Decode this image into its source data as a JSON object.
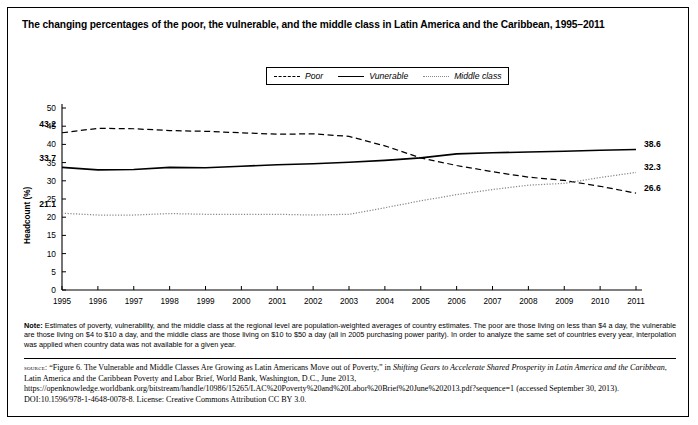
{
  "title": "The changing percentages of the poor, the vulnerable, and the middle class in Latin America and the Caribbean, 1995–2011",
  "legend": {
    "items": [
      {
        "label": "Poor",
        "style": "dashed",
        "color": "#000000"
      },
      {
        "label": "Vunerable",
        "style": "solid",
        "color": "#000000"
      },
      {
        "label": "Middle class",
        "style": "dotted",
        "color": "#888888"
      }
    ]
  },
  "axes": {
    "ylabel": "Headcount (%)",
    "yticks": [
      "0",
      "5",
      "10",
      "15",
      "20",
      "25",
      "30",
      "35",
      "40",
      "45",
      "50"
    ],
    "xticks": [
      "1995",
      "1996",
      "1997",
      "1998",
      "1999",
      "2000",
      "2001",
      "2002",
      "2003",
      "2004",
      "2005",
      "2006",
      "2007",
      "2008",
      "2009",
      "2010",
      "2011"
    ]
  },
  "annotations": {
    "start_poor": "43.2",
    "start_vulnerable": "33.7",
    "start_middle": "21.1",
    "end_vulnerable": "38.6",
    "end_middle": "32.3",
    "end_poor": "26.6"
  },
  "note": {
    "prefix": "Note:",
    "text": " Estimates of poverty, vulnerability, and the middle class at the regional level are population-weighted averages of country estimates. The poor are those living on less than $4 a day, the vulnerable are those living on $4 to $10 a day, and the middle class are those living on $10 to $50 a day (all in 2005 purchasing power parity). In order to analyze the same set of countries every year, interpolation was applied when country data was not available for a given year."
  },
  "source": {
    "prefix": "source:",
    "part1": " “Figure 6. The Vulnerable and Middle Classes Are Growing as Latin Americans Move out of Poverty,” in ",
    "italic1": "Shifting Gears to Accelerate Shared Prosperity in Latin America and the Caribbean",
    "part2": ", Latin America and the Caribbean Poverty and Labor Brief, World Bank, Washington, D.C., June 2013, https://openknowledge.worldbank.org/bitstream/handle/10986/15265/LAC%20Poverty%20and%20Labor%20Brief%20June%202013.pdf?sequence=1 (accessed September 30, 2013). DOI:10.1596/978-1-4648-0078-8. License: Creative Commons Attribution CC BY 3.0."
  },
  "chart_data": {
    "type": "line",
    "title": "The changing percentages of the poor, the vulnerable, and the middle class in Latin America and the Caribbean, 1995–2011",
    "xlabel": "",
    "ylabel": "Headcount (%)",
    "ylim": [
      0,
      50
    ],
    "ytick_step": 5,
    "grid": false,
    "legend_position": "top-center",
    "x": [
      1995,
      1996,
      1997,
      1998,
      1999,
      2000,
      2001,
      2002,
      2003,
      2004,
      2005,
      2006,
      2007,
      2008,
      2009,
      2010,
      2011
    ],
    "series": [
      {
        "name": "Poor",
        "style": "dashed",
        "color": "#000000",
        "values": [
          43.2,
          44.4,
          44.3,
          43.8,
          43.6,
          43.2,
          42.8,
          42.9,
          42.2,
          39.6,
          36.3,
          34.2,
          32.5,
          31.0,
          30.1,
          28.5,
          26.6
        ]
      },
      {
        "name": "Vunerable",
        "style": "solid",
        "color": "#000000",
        "values": [
          33.7,
          33.0,
          33.1,
          33.7,
          33.6,
          34.0,
          34.4,
          34.7,
          35.1,
          35.6,
          36.3,
          37.4,
          37.7,
          37.9,
          38.1,
          38.4,
          38.6
        ]
      },
      {
        "name": "Middle class",
        "style": "dotted",
        "color": "#888888",
        "values": [
          21.1,
          20.6,
          20.6,
          21.0,
          20.8,
          20.8,
          20.8,
          20.6,
          20.8,
          22.6,
          24.5,
          26.2,
          27.6,
          28.8,
          29.3,
          30.9,
          32.3
        ]
      }
    ],
    "annotated_points": [
      {
        "series": "Poor",
        "x": 1995,
        "value": 43.2
      },
      {
        "series": "Vunerable",
        "x": 1995,
        "value": 33.7
      },
      {
        "series": "Middle class",
        "x": 1995,
        "value": 21.1
      },
      {
        "series": "Vunerable",
        "x": 2011,
        "value": 38.6
      },
      {
        "series": "Middle class",
        "x": 2011,
        "value": 32.3
      },
      {
        "series": "Poor",
        "x": 2011,
        "value": 26.6
      }
    ]
  }
}
